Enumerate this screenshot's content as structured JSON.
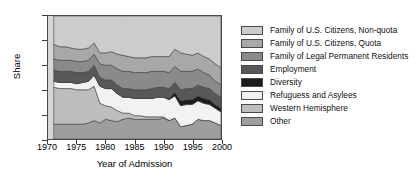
{
  "chart_data": {
    "type": "area",
    "title": "",
    "xlabel": "Year of Admission",
    "ylabel": "Share",
    "xlim": [
      1970,
      2000
    ],
    "ylim": [
      0,
      1
    ],
    "grid": false,
    "legend_position": "right",
    "stacked": true,
    "normalized": true,
    "xticks": [
      "1970",
      "1975",
      "1980",
      "1985",
      "1990",
      "1995",
      "2000"
    ],
    "yticks": [
      "0",
      "0.2",
      "0.4",
      "0.6",
      "0.8",
      "1"
    ],
    "x": [
      1971,
      1972,
      1973,
      1974,
      1975,
      1976,
      1977,
      1978,
      1979,
      1980,
      1981,
      1982,
      1983,
      1984,
      1985,
      1986,
      1987,
      1988,
      1989,
      1990,
      1991,
      1992,
      1993,
      1994,
      1995,
      1996,
      1997,
      1998,
      1999,
      2000
    ],
    "series": [
      {
        "name": "Family of U.S. Citizens, Non-quota",
        "color": "#cccccc",
        "values": [
          0.23,
          0.25,
          0.25,
          0.26,
          0.27,
          0.27,
          0.26,
          0.22,
          0.3,
          0.3,
          0.29,
          0.31,
          0.32,
          0.33,
          0.34,
          0.34,
          0.34,
          0.33,
          0.33,
          0.33,
          0.33,
          0.27,
          0.3,
          0.31,
          0.32,
          0.3,
          0.33,
          0.35,
          0.39,
          0.42
        ]
      },
      {
        "name": "Family of U.S. Citizens, Quota",
        "color": "#a8a8a8",
        "values": [
          0.12,
          0.11,
          0.11,
          0.1,
          0.1,
          0.1,
          0.1,
          0.09,
          0.09,
          0.1,
          0.11,
          0.12,
          0.13,
          0.12,
          0.12,
          0.12,
          0.12,
          0.12,
          0.12,
          0.12,
          0.13,
          0.14,
          0.15,
          0.14,
          0.13,
          0.13,
          0.13,
          0.13,
          0.14,
          0.14
        ]
      },
      {
        "name": "Family of Legal Permanent Residents",
        "color": "#8a8a8a",
        "values": [
          0.09,
          0.09,
          0.09,
          0.09,
          0.09,
          0.09,
          0.09,
          0.09,
          0.11,
          0.12,
          0.12,
          0.13,
          0.14,
          0.14,
          0.14,
          0.14,
          0.14,
          0.14,
          0.13,
          0.13,
          0.13,
          0.13,
          0.15,
          0.14,
          0.14,
          0.13,
          0.12,
          0.11,
          0.1,
          0.1
        ]
      },
      {
        "name": "Employment",
        "color": "#585858",
        "values": [
          0.09,
          0.09,
          0.09,
          0.09,
          0.09,
          0.08,
          0.08,
          0.08,
          0.07,
          0.07,
          0.07,
          0.07,
          0.07,
          0.07,
          0.07,
          0.07,
          0.07,
          0.08,
          0.08,
          0.08,
          0.08,
          0.08,
          0.09,
          0.09,
          0.09,
          0.09,
          0.09,
          0.09,
          0.09,
          0.09
        ]
      },
      {
        "name": "Diversity",
        "color": "#1c1c1c",
        "values": [
          0.0,
          0.0,
          0.0,
          0.0,
          0.0,
          0.0,
          0.0,
          0.0,
          0.0,
          0.0,
          0.0,
          0.0,
          0.0,
          0.0,
          0.0,
          0.0,
          0.0,
          0.0,
          0.0,
          0.0,
          0.01,
          0.03,
          0.04,
          0.04,
          0.04,
          0.04,
          0.04,
          0.04,
          0.03,
          0.03
        ]
      },
      {
        "name": "Refuguess and Asylees",
        "color": "#f2f2f2",
        "values": [
          0.05,
          0.05,
          0.05,
          0.05,
          0.05,
          0.06,
          0.07,
          0.09,
          0.14,
          0.14,
          0.15,
          0.14,
          0.13,
          0.13,
          0.14,
          0.14,
          0.15,
          0.15,
          0.16,
          0.16,
          0.17,
          0.18,
          0.17,
          0.17,
          0.16,
          0.15,
          0.14,
          0.13,
          0.12,
          0.11
        ]
      },
      {
        "name": "Western Hemisphere",
        "color": "#bdbdbd",
        "values": [
          0.3,
          0.29,
          0.29,
          0.29,
          0.28,
          0.28,
          0.27,
          0.28,
          0.16,
          0.11,
          0.11,
          0.09,
          0.05,
          0.04,
          0.03,
          0.03,
          0.02,
          0.02,
          0.02,
          0.01,
          0.0,
          0.0,
          0.0,
          0.0,
          0.0,
          0.0,
          0.0,
          0.0,
          0.0,
          0.0
        ]
      },
      {
        "name": "Other",
        "color": "#9e9e9e",
        "values": [
          0.12,
          0.12,
          0.12,
          0.12,
          0.12,
          0.12,
          0.13,
          0.15,
          0.13,
          0.16,
          0.15,
          0.14,
          0.16,
          0.17,
          0.16,
          0.16,
          0.16,
          0.16,
          0.16,
          0.17,
          0.15,
          0.17,
          0.1,
          0.11,
          0.12,
          0.16,
          0.15,
          0.15,
          0.13,
          0.11
        ]
      }
    ]
  },
  "legend": {
    "items": [
      {
        "label": "Family of U.S. Citizens, Non-quota",
        "color": "#cccccc"
      },
      {
        "label": "Family of U.S. Citizens, Quota",
        "color": "#a8a8a8"
      },
      {
        "label": "Family of Legal Permanent Residents",
        "color": "#8a8a8a"
      },
      {
        "label": "Employment",
        "color": "#585858"
      },
      {
        "label": "Diversity",
        "color": "#1c1c1c"
      },
      {
        "label": "Refuguess and Asylees",
        "color": "#f2f2f2"
      },
      {
        "label": "Western Hemisphere",
        "color": "#bdbdbd"
      },
      {
        "label": "Other",
        "color": "#9e9e9e"
      }
    ]
  }
}
